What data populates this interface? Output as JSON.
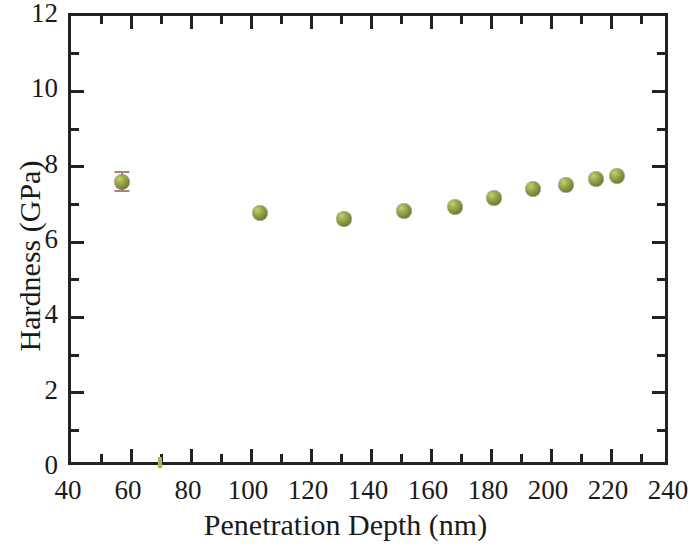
{
  "figure": {
    "background_color": "#ffffff",
    "frame_color": "#222222",
    "marker_color": "#8a9840",
    "errorbar_color": "#b77a86"
  },
  "axes": {
    "x_title": "Penetration Depth (nm)",
    "y_title": "Hardness (GPa)",
    "x_tick_labels": [
      "40",
      "60",
      "80",
      "100",
      "120",
      "140",
      "160",
      "180",
      "200",
      "220",
      "240"
    ],
    "y_tick_labels": [
      "0",
      "2",
      "4",
      "6",
      "8",
      "10",
      "12"
    ]
  },
  "chart_data": {
    "type": "scatter",
    "title": "",
    "xlabel": "Penetration Depth (nm)",
    "ylabel": "Hardness (GPa)",
    "xlim": [
      40,
      240
    ],
    "ylim": [
      0,
      12
    ],
    "x_major_ticks": [
      40,
      60,
      80,
      100,
      120,
      140,
      160,
      180,
      200,
      220,
      240
    ],
    "x_minor_ticks": [
      50,
      70,
      90,
      110,
      130,
      150,
      170,
      190,
      210,
      230
    ],
    "y_major_ticks": [
      0,
      2,
      4,
      6,
      8,
      10,
      12
    ],
    "y_minor_ticks": [
      1,
      3,
      5,
      7,
      9,
      11
    ],
    "grid": false,
    "legend": null,
    "marker_style": "3d-sphere",
    "series": [
      {
        "name": "Hardness vs penetration depth",
        "x": [
          57,
          103,
          131,
          151,
          168,
          181,
          194,
          205,
          215,
          222
        ],
        "y": [
          7.6,
          6.78,
          6.62,
          6.83,
          6.93,
          7.18,
          7.42,
          7.52,
          7.68,
          7.75
        ],
        "yerr": [
          0.25,
          0.05,
          0.1,
          0.05,
          0.05,
          0.07,
          0.05,
          0.05,
          0.05,
          0.05
        ]
      }
    ]
  }
}
